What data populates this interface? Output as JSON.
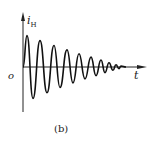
{
  "figure": {
    "y_axis_label": "i",
    "y_axis_subscript": "H",
    "x_axis_label": "t",
    "origin_label": "o",
    "caption": "(b)"
  },
  "chart_data": {
    "type": "line",
    "title": "",
    "xlabel": "t",
    "ylabel": "i_H",
    "grid": false,
    "legend": null,
    "series": [
      {
        "name": "i_H",
        "peaks": [
          {
            "x_px": 27,
            "y": 0.95
          },
          {
            "x_px": 40,
            "y": 0.8
          },
          {
            "x_px": 54,
            "y": 0.65
          },
          {
            "x_px": 67,
            "y": 0.52
          },
          {
            "x_px": 79,
            "y": 0.4
          },
          {
            "x_px": 91,
            "y": 0.3
          },
          {
            "x_px": 101,
            "y": 0.21
          },
          {
            "x_px": 109,
            "y": 0.13
          },
          {
            "x_px": 116,
            "y": 0.07
          },
          {
            "x_px": 121,
            "y": 0.03
          }
        ],
        "troughs": [
          {
            "x_px": 33,
            "y": -0.95
          },
          {
            "x_px": 47,
            "y": -0.78
          },
          {
            "x_px": 60,
            "y": -0.62
          },
          {
            "x_px": 73,
            "y": -0.48
          },
          {
            "x_px": 85,
            "y": -0.36
          },
          {
            "x_px": 96,
            "y": -0.26
          },
          {
            "x_px": 105,
            "y": -0.17
          },
          {
            "x_px": 113,
            "y": -0.1
          },
          {
            "x_px": 119,
            "y": -0.05
          }
        ]
      }
    ]
  }
}
